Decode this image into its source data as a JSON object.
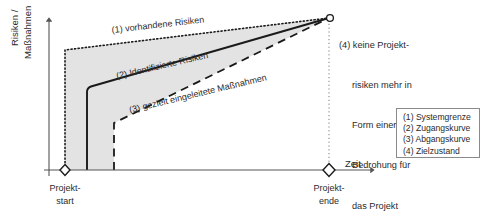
{
  "diagram": {
    "axes": {
      "y_label_line1": "Risiken /",
      "y_label_line2": "Maßnahmen",
      "x_label": "Zeit",
      "x_tick_start_line1": "Projekt-",
      "x_tick_start_line2": "start",
      "x_tick_end_line1": "Projekt-",
      "x_tick_end_line2": "ende"
    },
    "curve_labels": {
      "boundary": "(1) vorhandene Risiken",
      "entry": "(2) Identifizierte Risiken",
      "exit": "(3) gezielt eingeleitete Maßnahmen"
    },
    "note": {
      "line1": "(4) keine Projekt-",
      "line2": "risiken mehr in",
      "line3": "Form einer",
      "line4": "Bedrohung für",
      "line5": "das Projekt"
    },
    "legend": {
      "items": [
        "(1) Systemgrenze",
        "(2) Zugangskurve",
        "(3) Abgangskurve",
        "(4) Zielzustand"
      ]
    },
    "colors": {
      "fill": "#e3e3e3",
      "stroke": "#1a1a1a",
      "axis": "#555555",
      "text": "#2b2b2b",
      "legend_border": "#8a8a8a"
    }
  }
}
